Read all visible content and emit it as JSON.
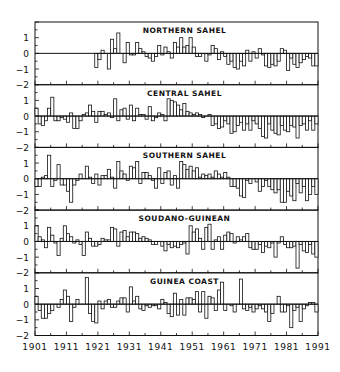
{
  "chart_data": {
    "type": "bar",
    "title": "",
    "xlabel": "",
    "ylabel": "",
    "x_start": 1901,
    "x_end": 1990,
    "xticks": [
      "1901",
      "1911",
      "1921",
      "1931",
      "1941",
      "1951",
      "1961",
      "1971",
      "1981",
      "1991"
    ],
    "ylim": [
      -2,
      2
    ],
    "yticks": [
      "1",
      "0",
      "-1",
      "-2"
    ],
    "grid": false,
    "panels": [
      {
        "name": "NORTHERN SAHEL",
        "start_year": 1920,
        "values": [
          -0.9,
          -0.4,
          0.2,
          0.0,
          -1.0,
          0.9,
          0.3,
          1.3,
          0.0,
          -0.6,
          0.7,
          -0.1,
          -0.1,
          0.7,
          0.3,
          0.1,
          -0.2,
          -0.3,
          -0.5,
          -0.2,
          0.5,
          -0.1,
          0.4,
          0.1,
          -0.3,
          0.7,
          0.4,
          1.0,
          0.4,
          0.5,
          1.0,
          0.4,
          -0.2,
          -0.2,
          0.0,
          -0.5,
          -0.1,
          0.5,
          0.3,
          -0.4,
          0.1,
          -0.2,
          -0.7,
          -0.5,
          -0.9,
          -1.0,
          -0.5,
          -0.8,
          0.2,
          -0.5,
          0.1,
          -0.3,
          0.3,
          -0.1,
          -0.8,
          -0.9,
          -0.7,
          -0.8,
          -0.5,
          0.3,
          0.2,
          -1.1,
          -0.3,
          -0.7,
          -0.9,
          -0.6,
          -0.4,
          -0.2,
          -0.3,
          -0.8,
          -0.8
        ]
      },
      {
        "name": "CENTRAL SAHEL",
        "values": [
          0.5,
          -0.5,
          -0.6,
          -0.3,
          0.5,
          1.2,
          -0.3,
          -0.3,
          -0.1,
          -0.2,
          -0.4,
          0.2,
          -0.8,
          -0.8,
          -0.3,
          0.1,
          0.2,
          0.7,
          0.3,
          -0.4,
          0.3,
          0.3,
          0.1,
          0.2,
          -0.1,
          1.1,
          -0.3,
          0.4,
          0.5,
          -0.2,
          0.7,
          -0.3,
          0.5,
          0.1,
          0.1,
          -0.2,
          0.6,
          -0.3,
          -0.1,
          0.2,
          0.1,
          -0.3,
          1.1,
          1.0,
          0.9,
          0.7,
          0.4,
          0.8,
          0.3,
          0.2,
          0.1,
          0.2,
          0.1,
          -0.1,
          0.0,
          0.1,
          -0.6,
          -0.5,
          -0.8,
          -0.7,
          -0.3,
          -0.5,
          -1.1,
          -1.0,
          -0.6,
          -0.4,
          -0.9,
          -0.5,
          -0.9,
          -0.3,
          -0.5,
          -0.8,
          -1.3,
          -1.4,
          -0.5,
          -0.9,
          -1.1,
          -1.2,
          -0.6,
          -0.9,
          -1.0,
          -0.6,
          -0.7,
          -1.4,
          -0.6,
          -0.5,
          -0.9,
          -0.3,
          -0.9,
          -0.5
        ]
      },
      {
        "name": "SOUTHERN SAHEL",
        "values": [
          -0.5,
          -0.5,
          0.1,
          0.2,
          1.5,
          -0.5,
          -0.1,
          0.9,
          -0.4,
          -0.4,
          -0.8,
          -1.5,
          -0.4,
          -0.1,
          0.3,
          0.0,
          0.8,
          0.1,
          -0.3,
          0.3,
          -0.4,
          0.2,
          0.2,
          0.6,
          0.1,
          -0.6,
          1.1,
          0.5,
          0.3,
          -0.1,
          0.8,
          0.7,
          1.1,
          -0.3,
          0.4,
          0.4,
          0.2,
          -0.1,
          -0.6,
          0.7,
          -0.3,
          0.4,
          0.5,
          -0.4,
          0.2,
          -0.6,
          1.1,
          0.9,
          0.6,
          0.8,
          0.5,
          0.7,
          0.1,
          0.3,
          0.2,
          0.3,
          0.1,
          0.5,
          0.3,
          0.1,
          0.4,
          0.1,
          -0.5,
          -0.5,
          -0.6,
          -1.1,
          -1.2,
          -0.1,
          -0.3,
          0.0,
          -0.2,
          -0.8,
          -0.5,
          -0.1,
          -0.5,
          -0.7,
          -0.9,
          -0.7,
          -1.5,
          -1.5,
          -0.8,
          -1.1,
          -1.4,
          -0.3,
          -0.9,
          -0.5,
          -1.4,
          -1.0,
          -0.5,
          -1.0
        ]
      },
      {
        "name": "SOUDANO-GUINEAN",
        "values": [
          1.0,
          0.3,
          0.1,
          -0.4,
          0.9,
          0.4,
          -0.1,
          -0.9,
          0.2,
          1.0,
          0.5,
          0.3,
          -0.1,
          0.1,
          -0.2,
          -0.9,
          0.6,
          0.2,
          -0.3,
          -0.3,
          -0.2,
          0.2,
          0.1,
          0.1,
          0.9,
          0.8,
          -0.3,
          0.6,
          0.7,
          0.3,
          0.6,
          0.6,
          0.5,
          0.2,
          0.3,
          0.2,
          0.1,
          -0.2,
          -0.2,
          0.0,
          -0.3,
          -0.6,
          -0.2,
          -0.4,
          -0.3,
          -0.4,
          -0.2,
          -0.1,
          -0.8,
          1.0,
          0.6,
          0.8,
          0.2,
          -0.5,
          0.9,
          1.1,
          -0.5,
          0.1,
          0.3,
          -0.5,
          0.4,
          0.6,
          0.5,
          -0.1,
          0.3,
          0.1,
          0.3,
          0.5,
          -0.4,
          -0.5,
          -0.5,
          -0.2,
          -0.7,
          -0.3,
          -0.4,
          -0.1,
          -1.0,
          -0.1,
          0.3,
          -0.2,
          -0.4,
          -0.4,
          -0.3,
          -1.7,
          -0.2,
          -0.6,
          -0.7,
          -0.2,
          -0.8,
          -1.0
        ]
      },
      {
        "name": "GUINEA COAST",
        "values": [
          0.5,
          -0.4,
          -0.9,
          -0.9,
          -0.6,
          -0.4,
          0.0,
          -0.2,
          0.3,
          0.9,
          0.5,
          -1.1,
          -0.2,
          0.3,
          0.0,
          0.0,
          1.7,
          -0.6,
          -1.1,
          -1.2,
          0.2,
          -0.3,
          0.2,
          0.3,
          -0.2,
          -0.2,
          0.2,
          0.4,
          0.4,
          -0.5,
          1.1,
          0.2,
          0.5,
          -0.3,
          -0.4,
          -0.1,
          -0.2,
          -0.1,
          -0.1,
          -0.3,
          0.3,
          0.1,
          -0.6,
          -0.8,
          0.7,
          -0.7,
          0.3,
          -0.7,
          0.4,
          0.4,
          0.3,
          0.8,
          -0.5,
          0.8,
          -0.9,
          0.5,
          0.4,
          -0.4,
          0.9,
          1.4,
          -0.4,
          0.0,
          -0.1,
          -0.5,
          0.0,
          1.6,
          -0.3,
          -0.4,
          -0.2,
          -0.5,
          -0.3,
          -0.1,
          -0.3,
          -0.5,
          -1.1,
          -0.6,
          0.0,
          0.5,
          -0.5,
          -0.5,
          -0.1,
          -1.5,
          -0.4,
          -0.2,
          -1.1,
          -0.3,
          -0.1,
          0.1,
          0.1,
          -0.5
        ]
      }
    ]
  }
}
